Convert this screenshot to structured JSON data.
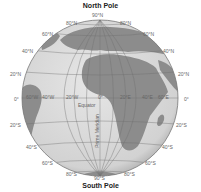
{
  "title_top": "North Pole",
  "title_bottom": "South Pole",
  "colors": {
    "ocean": "#d9d9d9",
    "land": "#8c8c8c",
    "grid": "#6e6e6e",
    "rim": "#777777",
    "label": "#666666"
  },
  "latitude_labels": {
    "top_center": "90°N",
    "n80_left": "80°N",
    "n80_right": "80°N",
    "n60_left": "60°N",
    "n60_right": "60°N",
    "n40_left": "40°N",
    "n40_right": "40°N",
    "n20_left": "20°N",
    "n20_right": "20°N",
    "eq_left": "0°",
    "eq_right": "0°",
    "s20_left": "20°S",
    "s20_right": "20°S",
    "s40_left": "40°S",
    "s40_right": "40°S",
    "s60_left": "60°S",
    "s60_right": "60°S",
    "s80_left": "80°S",
    "s80_right": "80°S",
    "bottom_center": "90°S"
  },
  "longitude_labels": [
    "60°W",
    "40°W",
    "20°W",
    "0°",
    "20°E",
    "40°E",
    "60°E"
  ],
  "equator_label": "Equator",
  "prime_meridian_label": "Prime Meridian"
}
